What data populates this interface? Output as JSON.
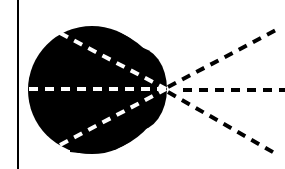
{
  "diagram": {
    "colors": {
      "background": "#ffffff",
      "blob": "#000000",
      "rays_inside": "#ffffff",
      "rays_outside": "#000000",
      "boundary_line": "#000000"
    },
    "boundary_line": {
      "x": 18,
      "y1": 0,
      "y2": 169
    },
    "focal_point": {
      "x": 166,
      "y": 89
    },
    "rays": [
      {
        "name": "upper",
        "start": [
          60,
          33
        ],
        "end": [
          278,
          29
        ]
      },
      {
        "name": "middle",
        "start": [
          29,
          89
        ],
        "end": [
          285,
          90
        ]
      },
      {
        "name": "lower",
        "start": [
          60,
          145
        ],
        "end": [
          278,
          155
        ]
      }
    ]
  }
}
